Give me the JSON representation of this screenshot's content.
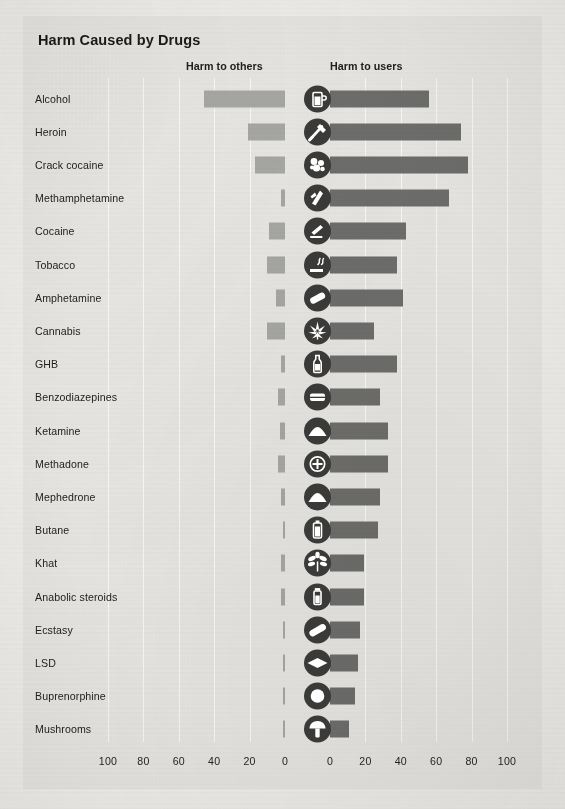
{
  "chart": {
    "title": "Harm Caused by Drugs",
    "left_header": "Harm to others",
    "right_header": "Harm to users"
  },
  "axis": {
    "left_ticks": [
      "100",
      "80",
      "60",
      "40",
      "20",
      "0"
    ],
    "right_ticks": [
      "0",
      "20",
      "40",
      "60",
      "80",
      "100"
    ]
  },
  "chart_data": {
    "type": "bar",
    "title": "Harm Caused by Drugs",
    "orientation": "horizontal-diverging",
    "xlabel": "",
    "ylabel": "",
    "xlim_left": [
      0,
      100
    ],
    "xlim_right": [
      0,
      100
    ],
    "grid": true,
    "legend_position": "top",
    "categories": [
      "Alcohol",
      "Heroin",
      "Crack cocaine",
      "Methamphetamine",
      "Cocaine",
      "Tobacco",
      "Amphetamine",
      "Cannabis",
      "GHB",
      "Benzodiazepines",
      "Ketamine",
      "Methadone",
      "Mephedrone",
      "Butane",
      "Khat",
      "Anabolic steroids",
      "Ecstasy",
      "LSD",
      "Buprenorphine",
      "Mushrooms"
    ],
    "series": [
      {
        "name": "Harm to others",
        "color": "#a6a6a3",
        "values": [
          46,
          21,
          17,
          2,
          9,
          10,
          5,
          10,
          2,
          4,
          3,
          4,
          2,
          1,
          2,
          2,
          1,
          1,
          1,
          1
        ]
      },
      {
        "name": "Harm to users",
        "color": "#6d6d6b",
        "values": [
          56,
          74,
          78,
          67,
          43,
          38,
          41,
          25,
          38,
          28,
          33,
          33,
          28,
          27,
          19,
          19,
          17,
          16,
          14,
          11
        ]
      }
    ],
    "icons": [
      "beer-glass-icon",
      "syringe-icon",
      "crack-rocks-icon",
      "meth-crystal-icon",
      "cocaine-lines-icon",
      "cigarette-icon",
      "pill-capsule-icon",
      "cannabis-leaf-icon",
      "bottle-icon",
      "tablet-icon",
      "powder-mound-icon",
      "cross-pill-icon",
      "powder-mound-icon",
      "gas-canister-icon",
      "khat-plant-icon",
      "vial-icon",
      "ecstasy-capsule-icon",
      "lsd-tab-icon",
      "round-pill-icon",
      "mushroom-icon"
    ]
  }
}
